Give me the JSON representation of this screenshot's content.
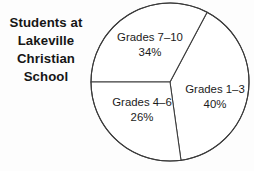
{
  "title": {
    "lines": [
      "Students at",
      "Lakeville",
      "Christian",
      "School"
    ],
    "full": "Students at Lakeville Christian School"
  },
  "chart_data": {
    "type": "pie",
    "title": "Students at Lakeville Christian School",
    "xlabel": "",
    "ylabel": "",
    "legend": "none",
    "grid": false,
    "units": "percent",
    "total": 100,
    "categories": [
      "Grades 1–3",
      "Grades 7–10",
      "Grades 4–6"
    ],
    "values": [
      40,
      34,
      26
    ],
    "slices": [
      {
        "label": "Grades 1–3",
        "percent_text": "40%",
        "value": 40,
        "start_angle_deg": -62,
        "end_angle_deg": 82,
        "fill": "#ffffff",
        "stroke": "#3a3a3a"
      },
      {
        "label": "Grades 7–10",
        "percent_text": "34%",
        "value": 34,
        "start_angle_deg": 180,
        "end_angle_deg": 298,
        "fill": "#ffffff",
        "stroke": "#3a3a3a"
      },
      {
        "label": "Grades 4–6",
        "percent_text": "26%",
        "value": 26,
        "start_angle_deg": 82,
        "end_angle_deg": 180,
        "fill": "#ffffff",
        "stroke": "#3a3a3a"
      }
    ],
    "geometry": {
      "center_x": 170,
      "center_y": 82,
      "radius": 79
    },
    "colors": {
      "outline": "#3a3a3a",
      "slice_fill": "#ffffff",
      "text": "#1b1b1b",
      "background": "#fdfdfd"
    }
  }
}
